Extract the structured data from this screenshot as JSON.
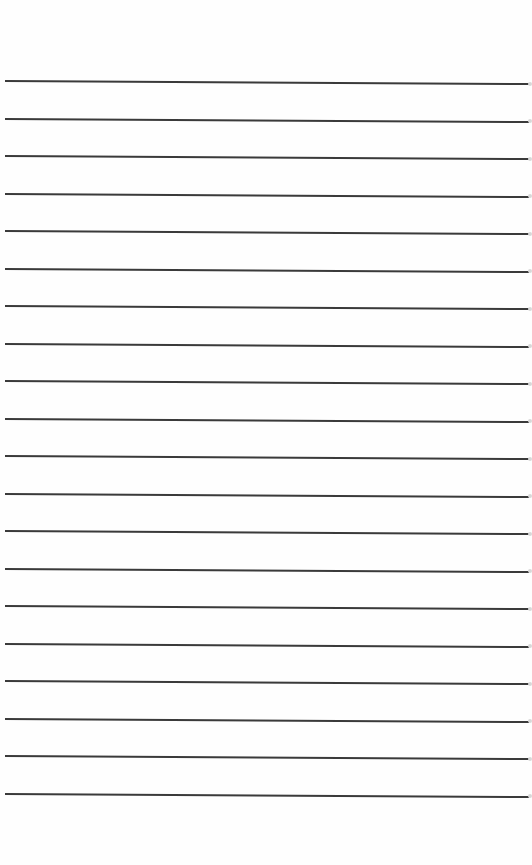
{
  "page": {
    "type": "lined-paper",
    "background": "#fefefe",
    "rule_color": "#3a3a3a",
    "rule_count": 20,
    "first_rule_y": 80,
    "rule_spacing": 37.5,
    "rule_left_x": 5,
    "rule_width": 524,
    "rule_tilt_deg": 0.33
  }
}
